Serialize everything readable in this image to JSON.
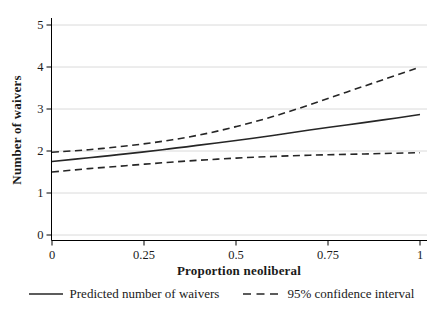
{
  "figure": {
    "background": "#ffffff",
    "series_color": "#262626",
    "grid_color": "#dadada",
    "axis_color": "#000000",
    "text_color": "#1a1a1a"
  },
  "chart_data": {
    "type": "line",
    "title": "",
    "xlabel": "Proportion neoliberal",
    "ylabel": "Number of waivers",
    "xlim": [
      0,
      1
    ],
    "ylim": [
      0,
      5
    ],
    "xticks": [
      0,
      0.25,
      0.5,
      0.75,
      1
    ],
    "xtick_labels": [
      "0",
      "0.25",
      "0.5",
      "0.75",
      "1"
    ],
    "yticks": [
      0,
      1,
      2,
      3,
      4,
      5
    ],
    "ytick_labels": [
      "0",
      "1",
      "2",
      "3",
      "4",
      "5"
    ],
    "grid": "horizontal gridlines only, light gray",
    "legend_position": "bottom-center",
    "x": [
      0,
      0.1,
      0.2,
      0.3,
      0.4,
      0.5,
      0.6,
      0.7,
      0.8,
      0.9,
      1.0
    ],
    "series": [
      {
        "name": "Predicted number of waivers",
        "line_style": "solid",
        "values": [
          1.75,
          1.84,
          1.93,
          2.03,
          2.14,
          2.25,
          2.37,
          2.5,
          2.62,
          2.74,
          2.87
        ]
      },
      {
        "name": "95% confidence interval (upper bound)",
        "line_style": "dashed",
        "values": [
          1.97,
          2.03,
          2.12,
          2.23,
          2.38,
          2.58,
          2.82,
          3.1,
          3.4,
          3.7,
          4.0
        ]
      },
      {
        "name": "95% confidence interval (lower bound)",
        "line_style": "dashed",
        "values": [
          1.5,
          1.58,
          1.65,
          1.72,
          1.78,
          1.83,
          1.87,
          1.9,
          1.92,
          1.94,
          1.96
        ]
      }
    ],
    "legend": [
      {
        "label": "Predicted number of waivers",
        "line_style": "solid"
      },
      {
        "label": "95% confidence interval",
        "line_style": "dashed"
      }
    ]
  }
}
